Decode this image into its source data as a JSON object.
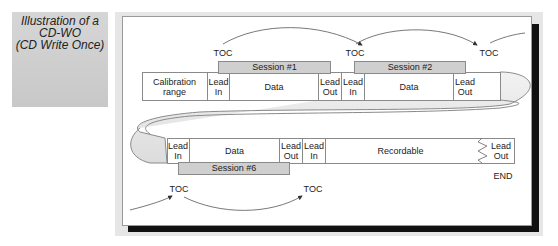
{
  "caption": {
    "line1": "Illustration of a",
    "line2": "CD-WO",
    "line3": "(CD Write Once)"
  },
  "diagram": {
    "top_toc_labels": [
      "TOC",
      "TOC",
      "TOC"
    ],
    "bottom_toc_labels": [
      "TOC",
      "TOC"
    ],
    "end_label": "END",
    "top_row": {
      "cells": [
        {
          "label": "Calibration range"
        },
        {
          "label": "Lead In"
        },
        {
          "label": "Data"
        },
        {
          "label": "Lead Out"
        },
        {
          "label": "Lead In"
        },
        {
          "label": "Data"
        },
        {
          "label": "Lead Out"
        }
      ],
      "sessions": [
        "Session #1",
        "Session #2"
      ]
    },
    "bottom_row": {
      "cells": [
        {
          "label": "Lead In"
        },
        {
          "label": "Data"
        },
        {
          "label": "Lead Out"
        },
        {
          "label": "Lead In"
        },
        {
          "label": "Recordable"
        },
        {
          "label": "Lead Out"
        }
      ],
      "sessions": [
        "Session #6"
      ]
    },
    "colors": {
      "caption_bg": "#cccccc",
      "session_fill": "#cfcfcf",
      "frame_shadow": "#111111",
      "stroke": "#8a8a8a"
    }
  }
}
